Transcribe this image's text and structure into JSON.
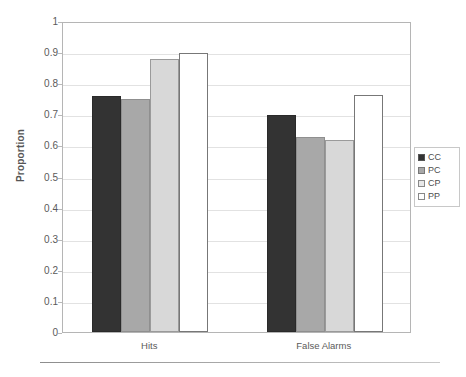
{
  "chart_data": {
    "type": "bar",
    "title": "",
    "xlabel": "",
    "ylabel": "Proportion",
    "categories": [
      "Hits",
      "False Alarms"
    ],
    "ylim": [
      0,
      1
    ],
    "ytick_labels": [
      "1",
      "0.9",
      "0.8",
      "0.7",
      "0.6",
      "0.5",
      "0.4",
      "0.3",
      "0.2",
      "0.1",
      "0"
    ],
    "ytick_values": [
      1,
      0.9,
      0.8,
      0.7,
      0.6,
      0.5,
      0.4,
      0.3,
      0.2,
      0.1,
      0
    ],
    "grid": true,
    "legend_position": "right",
    "series": [
      {
        "name": "CC",
        "color": "#333333",
        "values": [
          0.76,
          0.699
        ]
      },
      {
        "name": "PC",
        "color": "#a8a8a8",
        "values": [
          0.748,
          0.626
        ]
      },
      {
        "name": "CP",
        "color": "#d8d8d8",
        "values": [
          0.878,
          0.617
        ]
      },
      {
        "name": "PP",
        "color": "#ffffff",
        "values": [
          0.897,
          0.763
        ]
      }
    ]
  },
  "legend": {
    "items": [
      {
        "label": "CC",
        "swatch": "cc"
      },
      {
        "label": "PC",
        "swatch": "pc"
      },
      {
        "label": "CP",
        "swatch": "cp"
      },
      {
        "label": "PP",
        "swatch": "pp"
      }
    ]
  }
}
